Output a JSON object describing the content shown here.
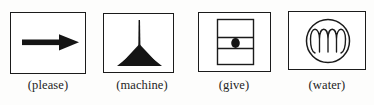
{
  "figure": {
    "name": "symbol-caption-row",
    "background_color": "#fdfdfc",
    "ink_color": "#1b1b1b",
    "caption_color": "#242424",
    "items": [
      {
        "id": "please",
        "icon_name": "right-arrow-icon",
        "symbol_description": "thick solid black arrow pointing right",
        "caption": "(please)"
      },
      {
        "id": "machine",
        "icon_name": "machine-spindle-icon",
        "symbol_description": "vertical line rising from a solid black triangular fan base",
        "caption": "(machine)"
      },
      {
        "id": "give",
        "icon_name": "give-panel-icon",
        "symbol_description": "upright rectangle crossed by two horizontal lines with a filled dot at the centre",
        "caption": "(give)"
      },
      {
        "id": "water",
        "icon_name": "water-wave-icon",
        "symbol_description": "circle enclosing a rounded wave line with three crests",
        "caption": "(water)"
      }
    ]
  }
}
